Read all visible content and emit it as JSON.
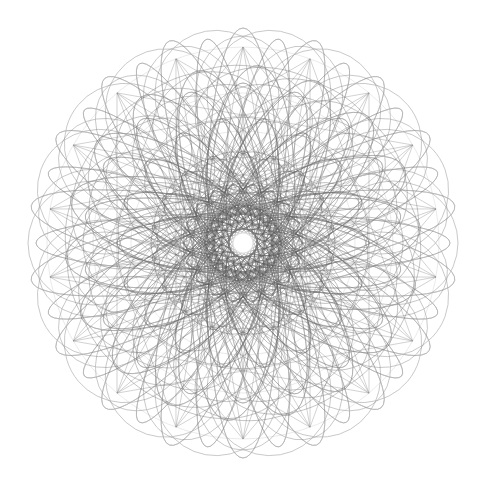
{
  "artwork": {
    "title": "Spirograph Rosette",
    "type": "generative-geometric-line-art",
    "caption": "",
    "canvas": {
      "width": 487,
      "height": 498,
      "background_color": "#ffffff"
    },
    "composition": {
      "center_x": 243,
      "center_y": 243,
      "outer_radius": 215,
      "rotational_symmetry": 18,
      "symmetry_label": "18-fold",
      "mirror_symmetry": true,
      "style": "overlapping rotated ellipses forming a mandala rosette"
    },
    "palette": {
      "background": "#ffffff",
      "stroke_light": "#9a9a9a",
      "stroke_mid": "#6f6f6f",
      "stroke_dark": "#4a4a4a",
      "core_accumulated": "#555555",
      "center_void": "#ffffff"
    },
    "center_void": {
      "radius": 9.5,
      "color": "#ffffff",
      "glow_radius": 14
    },
    "rings": [
      {
        "name": "outer-petals",
        "count": 18,
        "semi_major": 215,
        "semi_minor": 62,
        "offset": 150,
        "stroke": "#8a8a8a",
        "stroke_width": 0.75,
        "opacity": 0.62,
        "phase_deg": 0
      },
      {
        "name": "outer-petals-b",
        "count": 18,
        "semi_major": 207,
        "semi_minor": 48,
        "offset": 146,
        "stroke": "#7d7d7d",
        "stroke_width": 0.7,
        "opacity": 0.6,
        "phase_deg": 10
      },
      {
        "name": "mid-ring-large",
        "count": 18,
        "semi_major": 178,
        "semi_minor": 80,
        "offset": 120,
        "stroke": "#767676",
        "stroke_width": 0.72,
        "opacity": 0.6,
        "phase_deg": 5
      },
      {
        "name": "mid-ring",
        "count": 18,
        "semi_major": 160,
        "semi_minor": 58,
        "offset": 108,
        "stroke": "#6e6e6e",
        "stroke_width": 0.7,
        "opacity": 0.58,
        "phase_deg": 0
      },
      {
        "name": "inner-lobes",
        "count": 18,
        "semi_major": 126,
        "semi_minor": 46,
        "offset": 84,
        "stroke": "#666666",
        "stroke_width": 0.7,
        "opacity": 0.58,
        "phase_deg": 10
      },
      {
        "name": "core-lobes",
        "count": 18,
        "semi_major": 92,
        "semi_minor": 34,
        "offset": 60,
        "stroke": "#5c5c5c",
        "stroke_width": 0.68,
        "opacity": 0.6,
        "phase_deg": 0
      },
      {
        "name": "core-dense",
        "count": 18,
        "semi_major": 60,
        "semi_minor": 22,
        "offset": 40,
        "stroke": "#545454",
        "stroke_width": 0.66,
        "opacity": 0.62,
        "phase_deg": 10
      },
      {
        "name": "core-inner",
        "count": 18,
        "semi_major": 38,
        "semi_minor": 14,
        "offset": 26,
        "stroke": "#4f4f4f",
        "stroke_width": 0.64,
        "opacity": 0.6,
        "phase_deg": 5
      }
    ],
    "chords": {
      "name": "star-polygon-chords",
      "vertices": 18,
      "radius": 196,
      "skips": [
        5,
        7,
        8
      ],
      "stroke": "#6a6a6a",
      "stroke_width": 0.6,
      "opacity": 0.5
    },
    "circles": {
      "name": "concentric-rings",
      "radii": [
        196,
        150,
        112,
        78
      ],
      "stroke": "#8e8e8e",
      "stroke_width": 0.55,
      "opacity": 0.35
    }
  }
}
